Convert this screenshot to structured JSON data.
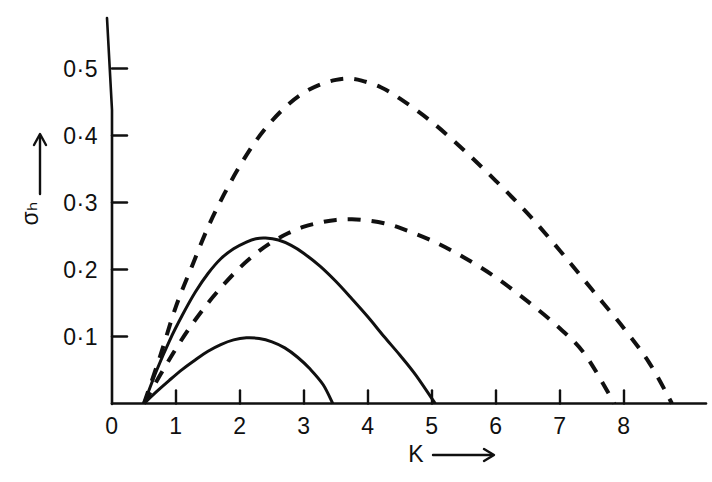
{
  "chart_data": {
    "type": "line",
    "title": "",
    "subtitle": "",
    "xlabel": "K",
    "ylabel": "σₕ",
    "xlabel_arrow": "⟶",
    "ylabel_arrow": "↑",
    "xlim": [
      0,
      9.1
    ],
    "ylim": [
      0,
      0.56
    ],
    "grid": false,
    "legend": "none",
    "xticks": [
      0,
      1,
      2,
      3,
      4,
      5,
      6,
      7,
      8
    ],
    "xtick_labels": [
      "0",
      "1",
      "2",
      "3",
      "4",
      "5",
      "6",
      "7",
      "8"
    ],
    "yticks": [
      0.1,
      0.2,
      0.3,
      0.4,
      0.5
    ],
    "ytick_labels": [
      "0·1",
      "0·2",
      "0·3",
      "0·4",
      "0·5"
    ],
    "line_color": "#101010",
    "series": [
      {
        "name": "upper-dashed-curve",
        "style": "dashed",
        "peak": {
          "x": 3.7,
          "y": 0.485
        },
        "x_start": 0.5,
        "x_end": 8.75,
        "points": [
          [
            0.5,
            0.0
          ],
          [
            0.75,
            0.07
          ],
          [
            1.0,
            0.145
          ],
          [
            1.25,
            0.205
          ],
          [
            1.5,
            0.263
          ],
          [
            1.75,
            0.312
          ],
          [
            2.0,
            0.355
          ],
          [
            2.25,
            0.392
          ],
          [
            2.5,
            0.422
          ],
          [
            2.75,
            0.446
          ],
          [
            3.0,
            0.464
          ],
          [
            3.25,
            0.476
          ],
          [
            3.5,
            0.483
          ],
          [
            3.7,
            0.485
          ],
          [
            3.9,
            0.482
          ],
          [
            4.2,
            0.472
          ],
          [
            4.5,
            0.455
          ],
          [
            5.0,
            0.42
          ],
          [
            5.5,
            0.378
          ],
          [
            6.0,
            0.332
          ],
          [
            6.5,
            0.283
          ],
          [
            7.0,
            0.228
          ],
          [
            7.5,
            0.17
          ],
          [
            8.0,
            0.112
          ],
          [
            8.4,
            0.06
          ],
          [
            8.75,
            0.0
          ]
        ]
      },
      {
        "name": "lower-dashed-curve",
        "style": "dashed",
        "peak": {
          "x": 3.75,
          "y": 0.275
        },
        "x_start": 0.5,
        "x_end": 7.85,
        "points": [
          [
            0.5,
            0.0
          ],
          [
            0.75,
            0.042
          ],
          [
            1.0,
            0.082
          ],
          [
            1.25,
            0.118
          ],
          [
            1.5,
            0.15
          ],
          [
            1.75,
            0.178
          ],
          [
            2.0,
            0.203
          ],
          [
            2.25,
            0.224
          ],
          [
            2.5,
            0.241
          ],
          [
            2.75,
            0.254
          ],
          [
            3.0,
            0.264
          ],
          [
            3.25,
            0.27
          ],
          [
            3.5,
            0.274
          ],
          [
            3.75,
            0.275
          ],
          [
            4.0,
            0.273
          ],
          [
            4.25,
            0.269
          ],
          [
            4.5,
            0.262
          ],
          [
            5.0,
            0.243
          ],
          [
            5.5,
            0.218
          ],
          [
            6.0,
            0.188
          ],
          [
            6.5,
            0.152
          ],
          [
            7.0,
            0.112
          ],
          [
            7.4,
            0.072
          ],
          [
            7.85,
            0.0
          ]
        ]
      },
      {
        "name": "upper-solid-curve",
        "style": "solid",
        "peak": {
          "x": 2.4,
          "y": 0.247
        },
        "x_start": 0.5,
        "x_end": 5.05,
        "points": [
          [
            0.5,
            0.0
          ],
          [
            0.7,
            0.05
          ],
          [
            0.9,
            0.094
          ],
          [
            1.1,
            0.132
          ],
          [
            1.3,
            0.166
          ],
          [
            1.5,
            0.194
          ],
          [
            1.7,
            0.216
          ],
          [
            1.9,
            0.231
          ],
          [
            2.1,
            0.241
          ],
          [
            2.25,
            0.246
          ],
          [
            2.4,
            0.247
          ],
          [
            2.6,
            0.244
          ],
          [
            2.8,
            0.236
          ],
          [
            3.0,
            0.224
          ],
          [
            3.25,
            0.205
          ],
          [
            3.5,
            0.182
          ],
          [
            3.75,
            0.156
          ],
          [
            4.0,
            0.129
          ],
          [
            4.25,
            0.1
          ],
          [
            4.5,
            0.072
          ],
          [
            4.75,
            0.042
          ],
          [
            5.05,
            0.0
          ]
        ]
      },
      {
        "name": "lower-solid-curve",
        "style": "solid",
        "peak": {
          "x": 2.1,
          "y": 0.098
        },
        "x_start": 0.5,
        "x_end": 3.45,
        "points": [
          [
            0.5,
            0.0
          ],
          [
            0.7,
            0.018
          ],
          [
            0.9,
            0.035
          ],
          [
            1.1,
            0.051
          ],
          [
            1.3,
            0.065
          ],
          [
            1.5,
            0.078
          ],
          [
            1.7,
            0.088
          ],
          [
            1.9,
            0.095
          ],
          [
            2.1,
            0.098
          ],
          [
            2.3,
            0.097
          ],
          [
            2.5,
            0.092
          ],
          [
            2.7,
            0.083
          ],
          [
            2.9,
            0.069
          ],
          [
            3.1,
            0.051
          ],
          [
            3.3,
            0.028
          ],
          [
            3.45,
            0.0
          ]
        ]
      }
    ]
  },
  "axes": {
    "x_axis_name": "K",
    "y_axis_name": "sigma-h"
  }
}
